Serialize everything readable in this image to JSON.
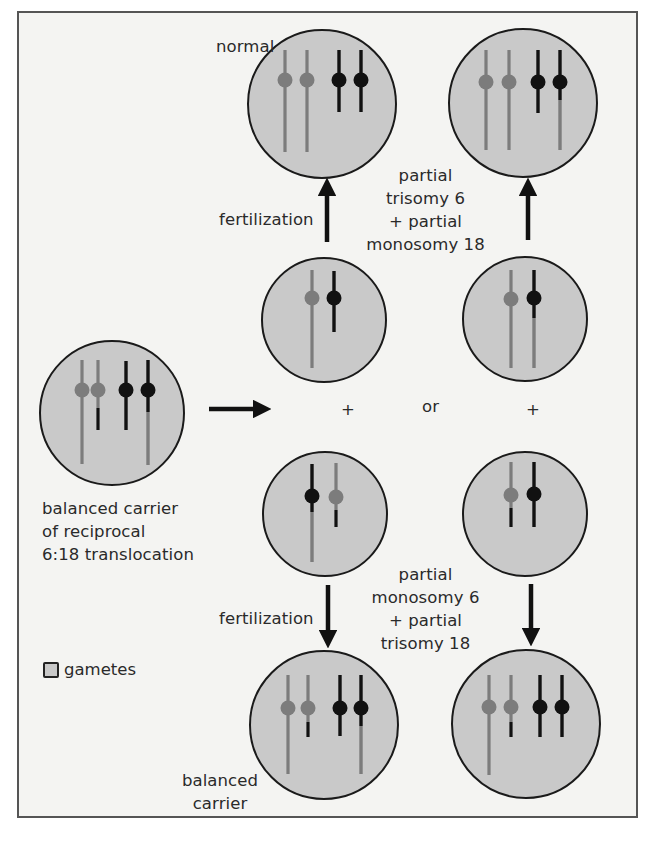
{
  "figure": {
    "colors": {
      "frame_border": "#555555",
      "background": "#f4f4f2",
      "cell_fill": "#c9c9c9",
      "cell_outline": "#1a1a1a",
      "chromosome_6": "#7c7c7c",
      "chromosome_18": "#111111"
    }
  },
  "labels": {
    "normal": "normal",
    "fertilization_top": "fertilization",
    "fertilization_bottom": "fertilization",
    "unbalanced_top": [
      "partial",
      "trisomy 6",
      "+ partial",
      "monosomy 18"
    ],
    "unbalanced_bottom": [
      "partial",
      "monosomy 6",
      "+ partial",
      "trisomy 18"
    ],
    "carrier_parent": [
      "balanced carrier",
      "of reciprocal",
      "6:18 translocation"
    ],
    "balanced_offspring": [
      "balanced",
      "carrier"
    ],
    "plus_left": "+",
    "plus_right": "+",
    "or": "or"
  },
  "legend": {
    "label": "gametes",
    "swatch": "gray-square-icon"
  },
  "cells": [
    {
      "id": "parent-carrier",
      "role": "balanced carrier of reciprocal 6:18 translocation",
      "cx": 112,
      "cy": 413,
      "r": 72,
      "chromosomes": [
        {
          "x": 82,
          "type": "gray",
          "top": 360,
          "cen": 390,
          "bottom": 464,
          "lower_color": "gray"
        },
        {
          "x": 98,
          "type": "gray",
          "top": 360,
          "cen": 390,
          "bottom": 430,
          "lower_color": "black",
          "lower_from": 408
        },
        {
          "x": 126,
          "type": "black",
          "top": 361,
          "cen": 390,
          "bottom": 430,
          "lower_color": "black"
        },
        {
          "x": 148,
          "type": "black",
          "top": 360,
          "cen": 390,
          "bottom": 465,
          "lower_color": "gray",
          "lower_from": 412
        }
      ]
    },
    {
      "id": "gamete-upper-left",
      "role": "gamete (normal)",
      "cx": 324,
      "cy": 320,
      "r": 62,
      "chromosomes": [
        {
          "x": 312,
          "type": "gray",
          "top": 270,
          "cen": 298,
          "bottom": 368,
          "lower_color": "gray"
        },
        {
          "x": 334,
          "type": "black",
          "top": 271,
          "cen": 298,
          "bottom": 332,
          "lower_color": "black"
        }
      ]
    },
    {
      "id": "gamete-upper-right",
      "role": "gamete (unbalanced)",
      "cx": 525,
      "cy": 319,
      "r": 62,
      "chromosomes": [
        {
          "x": 511,
          "type": "gray",
          "top": 270,
          "cen": 299,
          "bottom": 368,
          "lower_color": "gray"
        },
        {
          "x": 534,
          "type": "black",
          "top": 270,
          "cen": 298,
          "bottom": 368,
          "lower_color": "gray",
          "lower_from": 318
        }
      ]
    },
    {
      "id": "gamete-lower-left",
      "role": "gamete (balanced)",
      "cx": 325,
      "cy": 514,
      "r": 62,
      "chromosomes": [
        {
          "x": 312,
          "type": "black",
          "top": 464,
          "cen": 496,
          "bottom": 562,
          "lower_color": "gray",
          "lower_from": 512
        },
        {
          "x": 336,
          "type": "gray",
          "top": 463,
          "cen": 497,
          "bottom": 527,
          "lower_color": "black",
          "lower_from": 510
        }
      ]
    },
    {
      "id": "gamete-lower-right",
      "role": "gamete (unbalanced)",
      "cx": 525,
      "cy": 514,
      "r": 62,
      "chromosomes": [
        {
          "x": 511,
          "type": "gray",
          "top": 462,
          "cen": 495,
          "bottom": 527,
          "lower_color": "black",
          "lower_from": 508
        },
        {
          "x": 534,
          "type": "black",
          "top": 462,
          "cen": 494,
          "bottom": 527,
          "lower_color": "black"
        }
      ]
    },
    {
      "id": "zygote-normal",
      "role": "normal",
      "cx": 322,
      "cy": 104,
      "r": 74,
      "chromosomes": [
        {
          "x": 285,
          "type": "gray",
          "top": 50,
          "cen": 80,
          "bottom": 152,
          "lower_color": "gray"
        },
        {
          "x": 307,
          "type": "gray",
          "top": 50,
          "cen": 80,
          "bottom": 152,
          "lower_color": "gray"
        },
        {
          "x": 339,
          "type": "black",
          "top": 50,
          "cen": 80,
          "bottom": 112,
          "lower_color": "black"
        },
        {
          "x": 361,
          "type": "black",
          "top": 50,
          "cen": 80,
          "bottom": 112,
          "lower_color": "black"
        }
      ]
    },
    {
      "id": "zygote-partial-trisomy6",
      "role": "partial trisomy 6 + partial monosomy 18",
      "cx": 523,
      "cy": 103,
      "r": 74,
      "chromosomes": [
        {
          "x": 486,
          "type": "gray",
          "top": 50,
          "cen": 82,
          "bottom": 150,
          "lower_color": "gray"
        },
        {
          "x": 509,
          "type": "gray",
          "top": 50,
          "cen": 82,
          "bottom": 150,
          "lower_color": "gray"
        },
        {
          "x": 538,
          "type": "black",
          "top": 50,
          "cen": 82,
          "bottom": 113,
          "lower_color": "black"
        },
        {
          "x": 560,
          "type": "black",
          "top": 50,
          "cen": 82,
          "bottom": 150,
          "lower_color": "gray",
          "lower_from": 100
        }
      ]
    },
    {
      "id": "zygote-balanced-carrier",
      "role": "balanced carrier",
      "cx": 324,
      "cy": 725,
      "r": 74,
      "chromosomes": [
        {
          "x": 288,
          "type": "gray",
          "top": 675,
          "cen": 708,
          "bottom": 774,
          "lower_color": "gray"
        },
        {
          "x": 308,
          "type": "gray",
          "top": 675,
          "cen": 708,
          "bottom": 737,
          "lower_color": "black",
          "lower_from": 722
        },
        {
          "x": 340,
          "type": "black",
          "top": 675,
          "cen": 708,
          "bottom": 736,
          "lower_color": "black"
        },
        {
          "x": 361,
          "type": "black",
          "top": 675,
          "cen": 708,
          "bottom": 774,
          "lower_color": "gray",
          "lower_from": 726
        }
      ]
    },
    {
      "id": "zygote-partial-monosomy6",
      "role": "partial monosomy 6 + partial trisomy 18",
      "cx": 526,
      "cy": 724,
      "r": 74,
      "chromosomes": [
        {
          "x": 489,
          "type": "gray",
          "top": 675,
          "cen": 707,
          "bottom": 775,
          "lower_color": "gray"
        },
        {
          "x": 511,
          "type": "gray",
          "top": 675,
          "cen": 707,
          "bottom": 737,
          "lower_color": "black",
          "lower_from": 722
        },
        {
          "x": 540,
          "type": "black",
          "top": 675,
          "cen": 707,
          "bottom": 737,
          "lower_color": "black"
        },
        {
          "x": 562,
          "type": "black",
          "top": 675,
          "cen": 707,
          "bottom": 737,
          "lower_color": "black"
        }
      ]
    }
  ],
  "arrows": [
    {
      "id": "arrow-to-gametes",
      "direction": "right",
      "x1": 209,
      "y1": 409,
      "x2": 262,
      "y2": 409
    },
    {
      "id": "arrow-fertilization-up-left",
      "direction": "up",
      "x1": 327,
      "y1": 242,
      "x2": 327,
      "y2": 187
    },
    {
      "id": "arrow-fertilization-up-right",
      "direction": "up",
      "x1": 528,
      "y1": 240,
      "x2": 528,
      "y2": 187
    },
    {
      "id": "arrow-fertilization-down-left",
      "direction": "down",
      "x1": 328,
      "y1": 585,
      "x2": 328,
      "y2": 639
    },
    {
      "id": "arrow-fertilization-down-right",
      "direction": "down",
      "x1": 531,
      "y1": 584,
      "x2": 531,
      "y2": 637
    }
  ]
}
